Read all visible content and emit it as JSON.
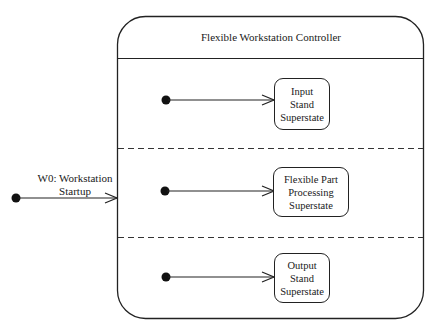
{
  "superstate": {
    "title": "Flexible Workstation Controller",
    "regions": [
      {
        "state_label": "Input\nStand\nSuperstate"
      },
      {
        "state_label": "Flexible Part\nProcessing\nSuperstate"
      },
      {
        "state_label": "Output\nStand\nSuperstate"
      }
    ]
  },
  "external_transition": {
    "label": "W0: Workstation\nStartup"
  },
  "colors": {
    "stroke": "#222222",
    "background": "#ffffff"
  }
}
